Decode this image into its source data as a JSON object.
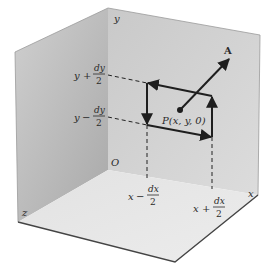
{
  "diagram": {
    "type": "3d-coordinate-box",
    "axes": {
      "x": "x",
      "y": "y",
      "z": "z",
      "origin": "O"
    },
    "point_label": "P(x, y, 0)",
    "vector_label": "A",
    "y_labels": {
      "upper": {
        "var": "y",
        "op": "+",
        "num": "dy",
        "den": "2"
      },
      "lower": {
        "var": "y",
        "op": "−",
        "num": "dy",
        "den": "2"
      }
    },
    "x_labels": {
      "left": {
        "var": "x",
        "op": "−",
        "num": "dx",
        "den": "2"
      },
      "right": {
        "var": "x",
        "op": "+",
        "num": "dx",
        "den": "2"
      }
    },
    "colors": {
      "back_wall": "#d4d4d4",
      "left_wall": "#b9b9b9",
      "floor": "#e6e6e6",
      "edge": "#555555",
      "ink": "#1e1e1e"
    }
  }
}
